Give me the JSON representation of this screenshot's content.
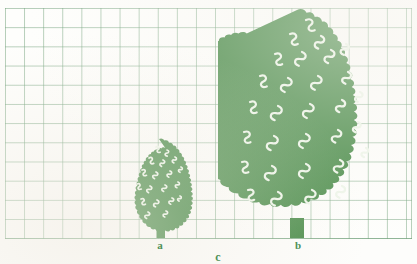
{
  "figure": {
    "background_color": "#fdfdfb",
    "grid_color": "#78a580",
    "grid_cell_px": 19,
    "foliage_color": "#4a8c4a",
    "foliage_shadow_color": "#3f8045",
    "highlight_color": "#eef6ea",
    "label_color": "#4f9158"
  },
  "labels": {
    "small_tree": "a",
    "large_tree": "b",
    "span": "c"
  },
  "trees": [
    {
      "id": "small-tree",
      "label": "a",
      "canopy_left_px": 131,
      "canopy_right_px": 187,
      "canopy_top_px": 140,
      "base_px": 238,
      "trunk_left_px": 157,
      "trunk_right_px": 165,
      "height_cells": 5,
      "width_cells": 3
    },
    {
      "id": "large-tree",
      "label": "b",
      "canopy_left_px": 225,
      "canopy_right_px": 375,
      "canopy_top_px": 12,
      "base_px": 238,
      "trunk_left_px": 290,
      "trunk_right_px": 303,
      "height_cells": 12,
      "width_cells": 8
    }
  ]
}
